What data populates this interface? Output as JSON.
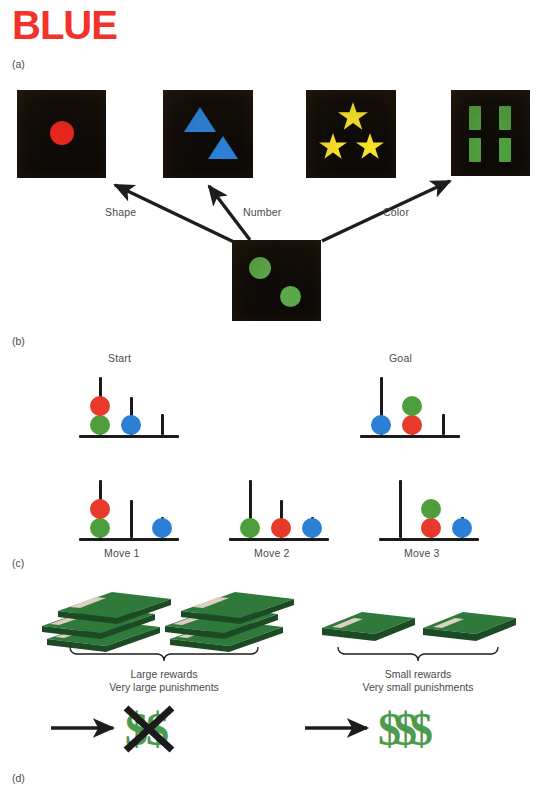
{
  "figure": {
    "title_word": "BLUE",
    "title_color": "#f3322c"
  },
  "panels": [
    {
      "id": "a",
      "letter": "(a)"
    },
    {
      "id": "b",
      "letter": "(b)"
    },
    {
      "id": "c",
      "letter": "(c)"
    },
    {
      "id": "d",
      "letter": "(d)"
    }
  ],
  "panel_a": {
    "letter": "(a)",
    "name": "card-sorting-task",
    "card_bg": "#0d0a07",
    "cards": [
      {
        "name": "card-one-red-circle",
        "count": 1,
        "shape": "circle",
        "color": "#e8261c",
        "color_name": "red"
      },
      {
        "name": "card-two-blue-triangles",
        "count": 2,
        "shape": "triangle",
        "color": "#2b7fd4",
        "color_name": "blue"
      },
      {
        "name": "card-three-yellow-stars",
        "count": 3,
        "shape": "star",
        "color": "#f7e12a",
        "color_name": "yellow"
      },
      {
        "name": "card-four-green-bars",
        "count": 4,
        "shape": "rectangle",
        "color": "#4e9e3e",
        "color_name": "green"
      }
    ],
    "reference_card": {
      "name": "reference-card-two-green-circles",
      "count": 2,
      "shape": "circle",
      "color": "#5aa84a",
      "color_name": "green"
    },
    "arrows": [
      {
        "label": "Shape",
        "target": "card-one-red-circle"
      },
      {
        "label": "Number",
        "target": "card-two-blue-triangles"
      },
      {
        "label": "Color",
        "target": "card-four-green-bars"
      }
    ]
  },
  "panel_b": {
    "letter": "(b)",
    "name": "tower-of-london-task",
    "ball_colors": {
      "red": "#e8392b",
      "green": "#4e9e3e",
      "blue": "#2b7fd4"
    },
    "peg_color": "#1b1b1b",
    "states": [
      {
        "label": "Start",
        "pegs": [
          {
            "height": "tall",
            "balls": [
              "green",
              "red"
            ]
          },
          {
            "height": "medium",
            "balls": [
              "blue"
            ]
          },
          {
            "height": "short",
            "balls": []
          }
        ]
      },
      {
        "label": "Goal",
        "pegs": [
          {
            "height": "tall",
            "balls": [
              "blue"
            ]
          },
          {
            "height": "medium",
            "balls": [
              "red",
              "green"
            ]
          },
          {
            "height": "short",
            "balls": []
          }
        ]
      },
      {
        "label": "Move 1",
        "pegs": [
          {
            "height": "tall",
            "balls": [
              "green",
              "red"
            ]
          },
          {
            "height": "medium",
            "balls": []
          },
          {
            "height": "short",
            "balls": [
              "blue"
            ]
          }
        ]
      },
      {
        "label": "Move 2",
        "pegs": [
          {
            "height": "tall",
            "balls": [
              "green"
            ]
          },
          {
            "height": "medium",
            "balls": [
              "red"
            ]
          },
          {
            "height": "short",
            "balls": [
              "blue"
            ]
          }
        ]
      },
      {
        "label": "Move 3",
        "pegs": [
          {
            "height": "tall",
            "balls": []
          },
          {
            "height": "medium",
            "balls": [
              "red",
              "green"
            ]
          },
          {
            "height": "short",
            "balls": [
              "blue"
            ]
          }
        ]
      }
    ]
  },
  "panel_cd": {
    "letter_c": "(c)",
    "letter_d": "(d)",
    "name": "gambling-task",
    "money_color_top": "#2f7a3a",
    "money_color_side": "#1b4a24",
    "band_color": "#ddcfc2",
    "dollar_color": "#4c9a4c",
    "cross_color": "#1b1b1b",
    "groups": [
      {
        "name": "large-reward-group",
        "deck_count": 2,
        "deck_size": "large",
        "caption_line_1": "Large rewards",
        "caption_line_2": "Very large punishments",
        "outcome_dollars": 2,
        "outcome_crossed": true
      },
      {
        "name": "small-reward-group",
        "deck_count": 2,
        "deck_size": "small",
        "caption_line_1": "Small rewards",
        "caption_line_2": "Very small punishments",
        "outcome_dollars": 3,
        "outcome_crossed": false
      }
    ]
  }
}
